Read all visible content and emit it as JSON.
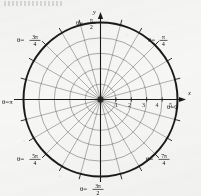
{
  "figure": {
    "kind": "polar-coordinate-grid",
    "background_color": "#f7f7f6",
    "ink_color": "#1a1a1a",
    "grid_color": "#5a5a5a",
    "header_smudge": ""
  },
  "axes": {
    "x_label": "x",
    "y_label": "y"
  },
  "chart_data": {
    "type": "polar-grid",
    "title": "",
    "xlabel": "x",
    "ylabel": "y",
    "grid": true,
    "legend": "none",
    "radial_ticks": [
      1,
      2,
      3,
      4,
      5
    ],
    "radial_tick_labels": [
      "1",
      "2",
      "3",
      "4",
      "5"
    ],
    "rlim": [
      0,
      5
    ],
    "num_circles": 5,
    "bold_outer_circle": true,
    "num_radial_spokes": 24,
    "spoke_step_degrees": 15,
    "angle_labels": [
      {
        "id": "theta-0",
        "text": "θ=0",
        "degrees": 0,
        "num": "",
        "den": "",
        "has_fraction": false
      },
      {
        "id": "theta-pi-4",
        "text": "θ=",
        "degrees": 45,
        "num": "π",
        "den": "4",
        "has_fraction": true
      },
      {
        "id": "theta-pi-2",
        "text": "θ=",
        "degrees": 90,
        "num": "π",
        "den": "2",
        "has_fraction": true
      },
      {
        "id": "theta-3pi-4",
        "text": "θ=",
        "degrees": 135,
        "num": "3π",
        "den": "4",
        "has_fraction": true
      },
      {
        "id": "theta-pi",
        "text": "θ=π",
        "degrees": 180,
        "num": "",
        "den": "",
        "has_fraction": false
      },
      {
        "id": "theta-5pi-4",
        "text": "θ=",
        "degrees": 225,
        "num": "5π",
        "den": "4",
        "has_fraction": true
      },
      {
        "id": "theta-3pi-2",
        "text": "θ=",
        "degrees": 270,
        "num": "3π",
        "den": "2",
        "has_fraction": true
      },
      {
        "id": "theta-7pi-4",
        "text": "θ=",
        "degrees": 315,
        "num": "7π",
        "den": "4",
        "has_fraction": true
      }
    ]
  },
  "labels": {
    "theta_0": "θ=0",
    "theta_pi": "θ=π",
    "theta_eq": "θ=",
    "pi_4_num": "π",
    "pi_4_den": "4",
    "pi_2_num": "π",
    "pi_2_den": "2",
    "three_pi_4_num": "3π",
    "three_pi_4_den": "4",
    "five_pi_4_num": "5π",
    "five_pi_4_den": "4",
    "three_pi_2_num": "3π",
    "three_pi_2_den": "2",
    "seven_pi_4_num": "7π",
    "seven_pi_4_den": "4",
    "tick_1": "1",
    "tick_2": "2",
    "tick_3": "3",
    "tick_4": "4",
    "tick_5": "5"
  }
}
